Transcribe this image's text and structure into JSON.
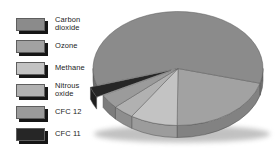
{
  "background": "#ffffff",
  "legend": {
    "swatch_shadow_color": "#161616",
    "items": [
      {
        "key": "carbon-dioxide",
        "text": "Carbon\ndioxide",
        "color": "#8b8b8b"
      },
      {
        "key": "ozone",
        "text": "Ozone",
        "color": "#a2a2a2"
      },
      {
        "key": "methane",
        "text": "Methane",
        "color": "#c3c3c3"
      },
      {
        "key": "nitrous-oxide",
        "text": "Nitrous\noxide",
        "color": "#b1b1b1"
      },
      {
        "key": "cfc-12",
        "text": "CFC 12",
        "color": "#9b9b9b"
      },
      {
        "key": "cfc-11",
        "text": "CFC 11",
        "color": "#262626"
      }
    ]
  },
  "chart_data": {
    "type": "pie",
    "style": "3d-exploded",
    "title": "",
    "labels": [
      "Carbon dioxide",
      "Ozone",
      "Methane",
      "Nitrous oxide",
      "CFC 12",
      "CFC 11"
    ],
    "values": [
      59,
      21,
      9,
      4,
      4,
      3
    ],
    "unit": "percent-estimated",
    "colors": [
      "#8b8b8b",
      "#a2a2a2",
      "#c3c3c3",
      "#b1b1b1",
      "#9b9b9b",
      "#262626"
    ],
    "exploded_label": "CFC 11",
    "legend_position": "left",
    "data_labels_shown": false
  }
}
